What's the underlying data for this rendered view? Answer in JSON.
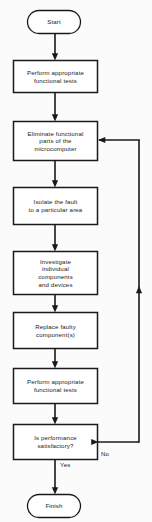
{
  "diagram": {
    "colors": {
      "background": "#fbfbfb",
      "stroke": "#1a1a1a",
      "text": "#1a1a1a",
      "node_fill": "#ffffff"
    },
    "nodes": [
      {
        "id": "start",
        "shape": "terminator",
        "label": "Start",
        "x": 27,
        "y": 10,
        "w": 54,
        "h": 24
      },
      {
        "id": "perform-tests-1",
        "shape": "process",
        "label": "Perform appropriate\nfunctional tests",
        "x": 13,
        "y": 60,
        "w": 85,
        "h": 33
      },
      {
        "id": "eliminate-functional-parts",
        "shape": "process",
        "label": "Eliminate functional\nparts of the\nmicrocomputer",
        "x": 13,
        "y": 121,
        "w": 85,
        "h": 40
      },
      {
        "id": "isolate-fault",
        "shape": "process",
        "label": "Isolate the fault\nto a particular area",
        "x": 13,
        "y": 187,
        "w": 85,
        "h": 38
      },
      {
        "id": "investigate-components",
        "shape": "process",
        "label": "Investigate\nindividual\ncomponents\nand devices",
        "x": 13,
        "y": 251,
        "w": 85,
        "h": 44
      },
      {
        "id": "replace-faulty-component",
        "shape": "process",
        "label": "Replace faulty\ncomponent(s)",
        "x": 13,
        "y": 312,
        "w": 85,
        "h": 37
      },
      {
        "id": "perform-tests-2",
        "shape": "process",
        "label": "Perform appropriate\nfunctional tests",
        "x": 13,
        "y": 368,
        "w": 85,
        "h": 36
      },
      {
        "id": "is-performance-satisfactory",
        "shape": "decision",
        "label": "Is performance\nsatisfactory?",
        "x": 13,
        "y": 424,
        "w": 85,
        "h": 36
      },
      {
        "id": "finish",
        "shape": "terminator",
        "label": "Finish",
        "x": 27,
        "y": 494,
        "w": 54,
        "h": 24
      }
    ],
    "edge_labels": [
      {
        "id": "no-label",
        "text": "No",
        "x": 101,
        "y": 455
      },
      {
        "id": "yes-label",
        "text": "Yes",
        "x": 60,
        "y": 466
      }
    ]
  }
}
